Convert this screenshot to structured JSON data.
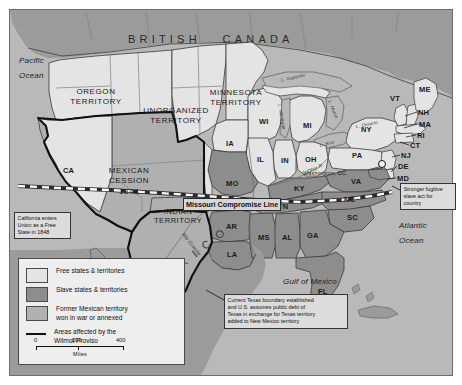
{
  "map": {
    "title": "United States 1850 - Compromise of 1850",
    "countries": [
      {
        "name": "british-canada",
        "label": "BRITISH   CANADA"
      },
      {
        "name": "mexico",
        "label": "M E X I C O"
      }
    ],
    "oceans": [
      {
        "name": "pacific-ocean",
        "line1": "Pacific",
        "line2": "Ocean"
      },
      {
        "name": "atlantic-ocean",
        "line1": "Atlantic",
        "line2": "Ocean"
      },
      {
        "name": "gulf-of-mexico",
        "label": "Gulf of Mexico"
      }
    ],
    "territories": [
      {
        "name": "oregon-territory",
        "line1": "OREGON",
        "line2": "TERRITORY"
      },
      {
        "name": "unorganized-territory",
        "line1": "UNORGANIZED",
        "line2": "TERRITORY"
      },
      {
        "name": "minnesota-territory",
        "line1": "MINNESOTA",
        "line2": "TERRITORY"
      },
      {
        "name": "mexican-cession",
        "line1": "MEXICAN",
        "line2": "CESSION",
        "line3": "1848"
      },
      {
        "name": "indian-territory",
        "line1": "INDIAN",
        "line2": "TERRITORY"
      }
    ],
    "states": [
      {
        "name": "ca",
        "label": "CA"
      },
      {
        "name": "tx",
        "label": "TX"
      },
      {
        "name": "ia",
        "label": "IA"
      },
      {
        "name": "mo",
        "label": "MO"
      },
      {
        "name": "ar",
        "label": "AR"
      },
      {
        "name": "la",
        "label": "LA"
      },
      {
        "name": "wi",
        "label": "WI"
      },
      {
        "name": "il",
        "label": "IL"
      },
      {
        "name": "in",
        "label": "IN"
      },
      {
        "name": "mi",
        "label": "MI"
      },
      {
        "name": "oh",
        "label": "OH"
      },
      {
        "name": "ky",
        "label": "KY"
      },
      {
        "name": "tn",
        "label": "TN"
      },
      {
        "name": "ms",
        "label": "MS"
      },
      {
        "name": "al",
        "label": "AL"
      },
      {
        "name": "ga",
        "label": "GA"
      },
      {
        "name": "fl",
        "label": "FL"
      },
      {
        "name": "sc",
        "label": "SC"
      },
      {
        "name": "nc",
        "label": "NC"
      },
      {
        "name": "va",
        "label": "VA"
      },
      {
        "name": "md",
        "label": "MD"
      },
      {
        "name": "de",
        "label": "DE"
      },
      {
        "name": "nj",
        "label": "NJ"
      },
      {
        "name": "pa",
        "label": "PA"
      },
      {
        "name": "ny",
        "label": "NY"
      },
      {
        "name": "ct",
        "label": "CT"
      },
      {
        "name": "ri",
        "label": "RI"
      },
      {
        "name": "ma",
        "label": "MA"
      },
      {
        "name": "nh",
        "label": "NH"
      },
      {
        "name": "vt",
        "label": "VT"
      },
      {
        "name": "me",
        "label": "ME"
      }
    ],
    "cities": [
      {
        "name": "washington-dc",
        "label": "Washington, DC"
      }
    ],
    "lakes": [
      {
        "name": "lake-superior",
        "label": "L. Superior"
      },
      {
        "name": "lake-michigan",
        "label": "L. Michigan"
      },
      {
        "name": "lake-huron",
        "label": "L. Huron"
      },
      {
        "name": "lake-erie",
        "label": "L. Erie"
      },
      {
        "name": "lake-ontario",
        "label": "L. Ontario"
      }
    ],
    "rivers": [
      {
        "name": "ohio-river",
        "label": "Ohio R."
      },
      {
        "name": "rio-grande",
        "label": "Rio Grande"
      }
    ],
    "compromise_line_label": "Missouri Compromise Line",
    "callouts": [
      {
        "name": "california-callout",
        "text": "California enters\nUnion as a Free\nState in 1848"
      },
      {
        "name": "fugitive-slave-callout",
        "text": "Stronger fugitive\nslave act for\ncountry"
      },
      {
        "name": "texas-boundary-callout",
        "text": "Current Texas boundary established\nand U.S. assumes public debt of\nTexas in exchange for Texas territory\nadded to New Mexico territory"
      }
    ]
  },
  "legend": {
    "items": [
      {
        "name": "legend-free-states",
        "type": "swatch",
        "color": "#e4e4e4",
        "text": "Free states & territories"
      },
      {
        "name": "legend-slave-states",
        "type": "swatch",
        "color": "#8d8d8d",
        "text": "Slave states & territories"
      },
      {
        "name": "legend-mexican-territory",
        "type": "swatch",
        "color": "#b0b0b0",
        "text": "Former Mexican territory\nwon in war or annexed"
      },
      {
        "name": "legend-wilmot-proviso",
        "type": "line",
        "color": "#111111",
        "text": "Areas affected by the\nWilmot Proviso"
      }
    ]
  },
  "scale": {
    "name": "scale-bar",
    "ticks": [
      "0",
      "200",
      "400"
    ],
    "units": "Miles"
  },
  "colors": {
    "free": "#e4e4e4",
    "slave": "#8d8d8d",
    "cession": "#b0b0b0",
    "water": "#b9b9b9",
    "outline": "#3a3a3a",
    "heavy_outline": "#111111"
  }
}
